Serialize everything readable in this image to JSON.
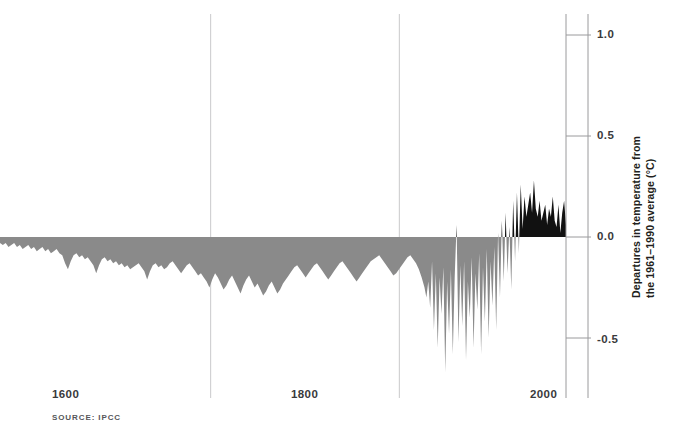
{
  "chart_data": {
    "type": "area",
    "title": "",
    "subtitle": "",
    "xlabel": "",
    "ylabel": "Departures in temperature from\nthe 1961–1990 average (°C)",
    "source": "SOURCE: IPCC",
    "xlim": [
      1400,
      2000
    ],
    "ylim": [
      -0.8,
      1.1
    ],
    "grid": true,
    "legend_position": "none",
    "x_ticks": [
      1600,
      1800,
      2000
    ],
    "x_tick_labels": [
      "1600",
      "1800",
      "2000"
    ],
    "y_ticks": [
      1.0,
      0.5,
      0.0,
      -0.5
    ],
    "y_tick_labels": [
      "1.0",
      "0.5",
      "0.0",
      "-0.5"
    ],
    "colors": {
      "negative_fill": "#8a8a8a",
      "positive_fill": "#111111",
      "gridline": "#c9c9cb",
      "axis": "#9a9a9c",
      "tick_label": "#3a3a3c",
      "background": "#ffffff"
    },
    "series_name": "Global temperature anomaly",
    "baseline": 0.0,
    "x": [
      1400,
      1403,
      1406,
      1409,
      1412,
      1415,
      1418,
      1421,
      1424,
      1427,
      1430,
      1433,
      1436,
      1439,
      1442,
      1445,
      1448,
      1451,
      1454,
      1457,
      1460,
      1463,
      1466,
      1469,
      1472,
      1475,
      1478,
      1481,
      1484,
      1487,
      1490,
      1493,
      1496,
      1499,
      1502,
      1505,
      1508,
      1511,
      1514,
      1517,
      1520,
      1523,
      1526,
      1529,
      1532,
      1535,
      1538,
      1541,
      1544,
      1547,
      1550,
      1553,
      1556,
      1559,
      1562,
      1565,
      1568,
      1571,
      1574,
      1577,
      1580,
      1583,
      1586,
      1589,
      1592,
      1595,
      1598,
      1601,
      1604,
      1607,
      1610,
      1613,
      1616,
      1619,
      1622,
      1625,
      1628,
      1631,
      1634,
      1637,
      1640,
      1643,
      1646,
      1649,
      1652,
      1655,
      1658,
      1661,
      1664,
      1667,
      1670,
      1673,
      1676,
      1679,
      1682,
      1685,
      1688,
      1691,
      1694,
      1697,
      1700,
      1703,
      1706,
      1709,
      1712,
      1715,
      1718,
      1721,
      1724,
      1727,
      1730,
      1733,
      1736,
      1739,
      1742,
      1745,
      1748,
      1751,
      1754,
      1757,
      1760,
      1763,
      1766,
      1769,
      1772,
      1775,
      1778,
      1781,
      1784,
      1787,
      1790,
      1793,
      1796,
      1799,
      1802,
      1805,
      1808,
      1811,
      1814,
      1817,
      1820,
      1823,
      1826,
      1829,
      1832,
      1835,
      1838,
      1841,
      1844,
      1847,
      1850,
      1852,
      1854,
      1856,
      1858,
      1860,
      1862,
      1864,
      1866,
      1868,
      1870,
      1872,
      1874,
      1876,
      1878,
      1880,
      1882,
      1884,
      1886,
      1888,
      1890,
      1892,
      1894,
      1896,
      1898,
      1900,
      1902,
      1904,
      1906,
      1908,
      1910,
      1912,
      1914,
      1916,
      1918,
      1920,
      1922,
      1924,
      1926,
      1928,
      1930,
      1932,
      1934,
      1936,
      1938,
      1940,
      1942,
      1944,
      1946,
      1948,
      1950,
      1952,
      1954,
      1956,
      1958,
      1960,
      1962,
      1964,
      1966,
      1968,
      1970,
      1972,
      1974,
      1976,
      1978,
      1980,
      1982,
      1984,
      1986,
      1988,
      1990,
      1992,
      1994,
      1996,
      1998,
      2000
    ],
    "y": [
      -0.03,
      -0.04,
      -0.03,
      -0.05,
      -0.04,
      -0.03,
      -0.05,
      -0.04,
      -0.06,
      -0.05,
      -0.04,
      -0.06,
      -0.05,
      -0.07,
      -0.06,
      -0.05,
      -0.07,
      -0.06,
      -0.08,
      -0.07,
      -0.06,
      -0.08,
      -0.09,
      -0.13,
      -0.16,
      -0.12,
      -0.09,
      -0.08,
      -0.1,
      -0.09,
      -0.11,
      -0.1,
      -0.12,
      -0.14,
      -0.18,
      -0.14,
      -0.11,
      -0.1,
      -0.12,
      -0.11,
      -0.13,
      -0.12,
      -0.14,
      -0.13,
      -0.15,
      -0.14,
      -0.16,
      -0.15,
      -0.14,
      -0.13,
      -0.15,
      -0.17,
      -0.21,
      -0.17,
      -0.14,
      -0.13,
      -0.15,
      -0.14,
      -0.16,
      -0.15,
      -0.13,
      -0.12,
      -0.14,
      -0.16,
      -0.18,
      -0.16,
      -0.14,
      -0.13,
      -0.15,
      -0.17,
      -0.19,
      -0.18,
      -0.2,
      -0.22,
      -0.25,
      -0.21,
      -0.18,
      -0.2,
      -0.23,
      -0.26,
      -0.24,
      -0.21,
      -0.19,
      -0.22,
      -0.25,
      -0.28,
      -0.24,
      -0.21,
      -0.19,
      -0.22,
      -0.25,
      -0.23,
      -0.26,
      -0.29,
      -0.27,
      -0.24,
      -0.22,
      -0.25,
      -0.28,
      -0.26,
      -0.23,
      -0.21,
      -0.19,
      -0.17,
      -0.15,
      -0.14,
      -0.16,
      -0.18,
      -0.2,
      -0.18,
      -0.16,
      -0.14,
      -0.13,
      -0.15,
      -0.17,
      -0.19,
      -0.21,
      -0.19,
      -0.17,
      -0.15,
      -0.13,
      -0.12,
      -0.14,
      -0.16,
      -0.18,
      -0.2,
      -0.22,
      -0.2,
      -0.18,
      -0.16,
      -0.14,
      -0.12,
      -0.11,
      -0.1,
      -0.09,
      -0.11,
      -0.13,
      -0.15,
      -0.17,
      -0.19,
      -0.18,
      -0.16,
      -0.14,
      -0.12,
      -0.1,
      -0.09,
      -0.11,
      -0.13,
      -0.16,
      -0.2,
      -0.25,
      -0.3,
      -0.22,
      -0.35,
      -0.12,
      -0.46,
      -0.18,
      -0.55,
      -0.2,
      -0.38,
      -0.15,
      -0.67,
      -0.22,
      -0.48,
      -0.16,
      -0.58,
      -0.2,
      0.06,
      -0.52,
      -0.14,
      -0.44,
      -0.12,
      -0.61,
      -0.22,
      -0.4,
      -0.1,
      -0.55,
      -0.18,
      -0.36,
      -0.08,
      -0.58,
      -0.15,
      -0.42,
      -0.06,
      -0.5,
      -0.12,
      -0.34,
      -0.05,
      -0.46,
      0.02,
      -0.3,
      0.08,
      -0.22,
      0.12,
      -0.18,
      0.05,
      -0.26,
      0.18,
      -0.12,
      0.22,
      -0.08,
      0.26,
      0.04,
      0.2,
      0.1,
      0.16,
      0.22,
      0.12,
      0.28,
      0.14,
      0.1,
      0.18,
      0.08,
      0.12,
      0.16,
      0.06,
      0.14,
      0.1,
      0.2,
      0.08,
      0.05,
      0.16,
      0.02,
      0.12,
      0.18,
      0.06,
      0.1,
      0.24,
      0.14,
      0.08,
      0.3,
      0.12,
      0.42,
      0.18,
      0.36,
      0.24,
      0.5,
      0.3,
      0.65
    ]
  },
  "axis": {
    "y_label_line1": "Departures in temperature from",
    "y_label_line2": "the 1961–1990 average (°C)"
  },
  "footer": {
    "source": "SOURCE: IPCC"
  }
}
